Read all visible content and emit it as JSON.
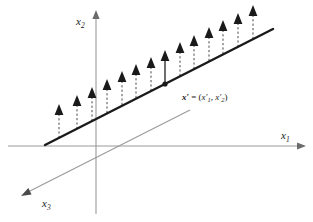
{
  "figure": {
    "background_color": "#ffffff",
    "width": 313,
    "height": 222
  },
  "axes": {
    "color": "#9a9a9a",
    "items": [
      {
        "name": "x1",
        "label_main": "x",
        "label_sub": "1",
        "description": "horizontal axis pointing right",
        "label_x": 281,
        "label_y": 139,
        "x1": 8,
        "y1": 146,
        "x2": 306,
        "y2": 146
      },
      {
        "name": "x2",
        "label_main": "x",
        "label_sub": "2",
        "description": "vertical axis pointing up",
        "label_x": 80,
        "label_y": 25,
        "x1": 96,
        "y1": 214,
        "x2": 96,
        "y2": 10
      },
      {
        "name": "x3",
        "label_main": "x",
        "label_sub": "3",
        "description": "diagonal axis pointing down-left",
        "label_x": 46,
        "label_y": 208,
        "x1": 190,
        "y1": 110,
        "x2": 21,
        "y2": 196
      }
    ]
  },
  "line": {
    "name": "solution-line",
    "color": "#1a1a1a",
    "width": 2.4,
    "x1": 45,
    "y1": 145,
    "x2": 273,
    "y2": 29
  },
  "point": {
    "name": "x-prime",
    "cx": 165,
    "cy": 84,
    "radius": 2.6,
    "color": "#1a1a1a",
    "label": {
      "prefix": "x",
      "prime": "′",
      "equals": " = (",
      "comp1_main": "x",
      "comp1_prime": "′",
      "comp1_sub": "1",
      "separator": ", ",
      "comp2_main": "x",
      "comp2_prime": "′",
      "comp2_sub": "2",
      "suffix": ")",
      "x": 182,
      "y": 100
    }
  },
  "arrows": {
    "dash_color": "#4a4a4a",
    "solid_color": "#555555",
    "head_color": "#1a1a1a",
    "length": 34,
    "count": 14,
    "highlight_index": 7,
    "items": [
      {
        "x": 59,
        "y_base": 138,
        "style": "dashed"
      },
      {
        "x": 77,
        "y_base": 129,
        "style": "dashed"
      },
      {
        "x": 92,
        "y_base": 121,
        "style": "dashed"
      },
      {
        "x": 107,
        "y_base": 113,
        "style": "dashed"
      },
      {
        "x": 122,
        "y_base": 105,
        "style": "dashed"
      },
      {
        "x": 136,
        "y_base": 98,
        "style": "dashed"
      },
      {
        "x": 151,
        "y_base": 91,
        "style": "dashed"
      },
      {
        "x": 165,
        "y_base": 84,
        "style": "solid"
      },
      {
        "x": 180,
        "y_base": 76,
        "style": "dashed"
      },
      {
        "x": 194,
        "y_base": 69,
        "style": "dashed"
      },
      {
        "x": 209,
        "y_base": 61,
        "style": "dashed"
      },
      {
        "x": 223,
        "y_base": 54,
        "style": "dashed"
      },
      {
        "x": 238,
        "y_base": 47,
        "style": "dashed"
      },
      {
        "x": 253,
        "y_base": 39,
        "style": "dashed"
      }
    ]
  }
}
